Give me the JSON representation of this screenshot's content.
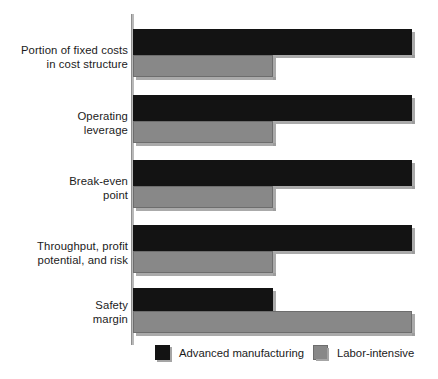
{
  "chart_data": {
    "type": "bar",
    "orientation": "horizontal",
    "title": "",
    "subtitle": "",
    "xlabel": "",
    "ylabel": "",
    "grid": false,
    "xlim": [
      0,
      100
    ],
    "x_axis_ticks": [],
    "legend_position": "bottom",
    "categories": [
      "Portion of fixed costs\nin cost structure",
      "Operating\nleverage",
      "Break-even\npoint",
      "Throughput, profit\npotential, and risk",
      "Safety\nmargin"
    ],
    "series": [
      {
        "name": "Advanced manufacturing",
        "color": "#131313",
        "values": [
          100,
          100,
          100,
          100,
          50
        ]
      },
      {
        "name": "Labor-intensive",
        "color": "#888888",
        "values": [
          50,
          50,
          50,
          50,
          100
        ]
      }
    ]
  },
  "axis": {
    "color": "#b9b9b9"
  },
  "legend": {
    "items": [
      {
        "label": "Advanced manufacturing",
        "swatch": "black"
      },
      {
        "label": "Labor-intensive",
        "swatch": "gray"
      }
    ]
  },
  "colors": {
    "series_black": "#131313",
    "series_gray": "#888888",
    "background": "#ffffff",
    "text": "#1b1b1b",
    "shadow": "#9b9b9b"
  }
}
